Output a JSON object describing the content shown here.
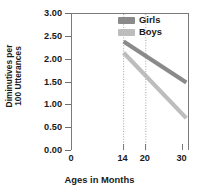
{
  "chart_data": {
    "type": "line",
    "title": "",
    "xlabel": "Ages in Months",
    "ylabel_line1": "Diminutives per",
    "ylabel_line2": "100 Utterances",
    "xlim": [
      0,
      32
    ],
    "ylim": [
      0.0,
      3.0
    ],
    "x_ticks": [
      "0",
      "14",
      "20",
      "30"
    ],
    "x_tick_values": [
      0,
      14,
      20,
      30
    ],
    "y_ticks": [
      "0.00",
      "0.50",
      "1.00",
      "1.50",
      "2.00",
      "2.50",
      "3.00"
    ],
    "y_tick_values": [
      0.0,
      0.5,
      1.0,
      1.5,
      2.0,
      2.5,
      3.0
    ],
    "grid": false,
    "legend_position": "top-right-inside",
    "reference_lines": [
      {
        "x": 14,
        "style": "dotted"
      },
      {
        "x": 20,
        "style": "dotted"
      }
    ],
    "series": [
      {
        "name": "Girls",
        "color": "#8a8a8a",
        "x": [
          14,
          31
        ],
        "values": [
          2.4,
          1.5
        ]
      },
      {
        "name": "Boys",
        "color": "#bdbdbd",
        "x": [
          14,
          31
        ],
        "values": [
          2.15,
          0.72
        ]
      }
    ]
  },
  "legend": {
    "items": [
      {
        "label": "Girls",
        "color": "#8a8a8a"
      },
      {
        "label": "Boys",
        "color": "#bdbdbd"
      }
    ]
  },
  "colors": {
    "girls": "#8a8a8a",
    "boys": "#bdbdbd",
    "axis": "#7a7a7a",
    "text": "#1a1a1a",
    "background": "#ffffff"
  }
}
